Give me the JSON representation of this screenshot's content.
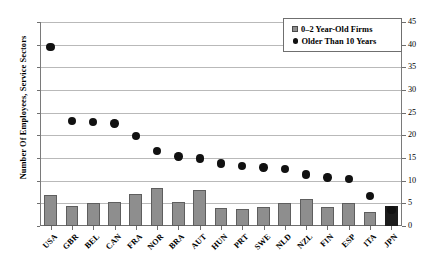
{
  "chart_data": {
    "type": "bar",
    "title": "",
    "subtitle": "",
    "xlabel": "",
    "ylabel": "Number Of Employees, Service Sectors",
    "ylim": [
      0,
      45
    ],
    "ytick_step": 5,
    "yticks": [
      0,
      5,
      10,
      15,
      20,
      25,
      30,
      35,
      40,
      45
    ],
    "yticks_right": [
      0,
      5,
      10,
      15,
      20,
      25,
      30,
      35,
      40,
      45
    ],
    "dual_axis": true,
    "grid": true,
    "grid_axis": "y",
    "legend_position": "top-right",
    "categories": [
      "USA",
      "GBR",
      "BEL",
      "CAN",
      "FRA",
      "NOR",
      "BRA",
      "AUT",
      "HUN",
      "PRT",
      "SWE",
      "NLD",
      "NZL",
      "FIN",
      "ESP",
      "ITA",
      "JPN"
    ],
    "series": [
      {
        "name": "0–2 Year-Old Firms",
        "type": "bar",
        "color": "#8e8e8e",
        "values": [
          6.8,
          4.5,
          5.0,
          5.2,
          7.1,
          8.4,
          5.3,
          8.0,
          3.9,
          3.8,
          4.2,
          5.0,
          5.9,
          4.1,
          5.1,
          3.0,
          4.4
        ]
      },
      {
        "name": "Older Than 10 Years",
        "type": "scatter",
        "color": "#111111",
        "values": [
          39.5,
          23.2,
          23.0,
          22.6,
          19.9,
          16.6,
          15.3,
          14.9,
          13.8,
          13.2,
          12.9,
          12.6,
          11.4,
          10.7,
          10.4,
          6.6,
          3.5
        ]
      }
    ],
    "annotations": []
  },
  "legend": {
    "items": [
      {
        "label": "0–2 Year-Old Firms",
        "marker": "bar-swatch"
      },
      {
        "label": "Older Than 10 Years",
        "marker": "dot-swatch"
      }
    ]
  },
  "axis": {
    "y_title": "Number Of Employees, Service Sectors"
  }
}
